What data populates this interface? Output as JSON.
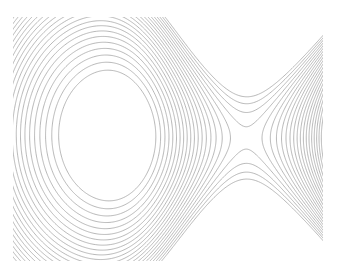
{
  "figure": {
    "title": "",
    "background_color": "#ffffff",
    "width": 337,
    "height": 273
  },
  "chart_data": {
    "type": "contour",
    "title": "",
    "subtitle": "",
    "xlabel": "",
    "ylabel": "",
    "xlim": [
      -3.0,
      3.0
    ],
    "ylim": [
      -2.4,
      2.4
    ],
    "grid": false,
    "axes_visible": false,
    "ticks_visible": false,
    "legend": null,
    "colorbar": false,
    "line_color": "#9a9a9a",
    "line_width": 0.7,
    "filled": false,
    "features": [
      {
        "name": "elliptical-minimum",
        "kind": "minimum",
        "center_px": [
          97,
          135
        ],
        "center_data": [
          -1.4,
          0.0
        ],
        "semi_axis_x_px": 40,
        "semi_axis_y_px": 53,
        "level": 0.0
      },
      {
        "name": "saddle-point",
        "kind": "saddle",
        "center_px": [
          247,
          138
        ],
        "center_data": [
          1.5,
          0.0
        ],
        "level": 9.0,
        "separatrix_slope": 0.92
      }
    ],
    "plot_area_px": {
      "x": 13,
      "y": 17,
      "width": 310,
      "height": 244
    },
    "n_levels": 22,
    "level_step": 1.0,
    "levels": [
      0.5,
      1.0,
      1.5,
      2.0,
      2.5,
      3.0,
      3.5,
      4.0,
      4.5,
      5.0,
      5.5,
      6.0,
      6.5,
      7.0,
      7.5,
      8.0,
      8.5,
      9.0,
      9.5,
      10.0,
      10.5,
      11.0
    ]
  }
}
